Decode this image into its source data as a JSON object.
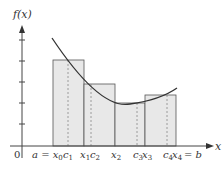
{
  "diagram": {
    "type": "riemann-sum-midpoint",
    "y_axis_label": "f(x)",
    "x_axis_label": "x",
    "origin_label": "0",
    "x_labels": [
      {
        "text": "a = x",
        "sub": "0",
        "x": 53
      },
      {
        "text": "c",
        "sub": "1",
        "x": 68
      },
      {
        "text": "x",
        "sub": "1",
        "x": 84
      },
      {
        "text": "c",
        "sub": "2",
        "x": 91
      },
      {
        "text": "x",
        "sub": "2",
        "x": 115
      },
      {
        "text": "c",
        "sub": "3",
        "x": 137
      },
      {
        "text": "x",
        "sub": "3",
        "x": 145
      },
      {
        "text": "c",
        "sub": "4",
        "x": 167
      },
      {
        "text": "x",
        "sub": "4",
        "x": 176
      },
      {
        "text": "= b",
        "sub": "",
        "x": 190
      }
    ],
    "rectangles": [
      {
        "x0": 53,
        "x1": 84,
        "top": 60,
        "mid": 68
      },
      {
        "x0": 84,
        "x1": 115,
        "top": 84,
        "mid": 91
      },
      {
        "x0": 115,
        "x1": 145,
        "top": 103,
        "mid": 137
      },
      {
        "x0": 145,
        "x1": 176,
        "top": 95,
        "mid": 167
      }
    ],
    "colors": {
      "rect_fill": "#e8e8e8",
      "rect_stroke": "#555555",
      "curve": "#333333",
      "axis": "#444444",
      "dashed": "#888888"
    }
  }
}
